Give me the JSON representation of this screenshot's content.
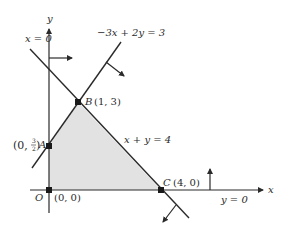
{
  "diagram": {
    "type": "linear-programming-feasible-region",
    "axes": {
      "x_label": "x",
      "y_label": "y"
    },
    "constraints": [
      {
        "id": "x0",
        "label": "x = 0"
      },
      {
        "id": "l1",
        "label": "−3x + 2y = 3"
      },
      {
        "id": "l2",
        "label": "x + y = 4"
      },
      {
        "id": "y0",
        "label": "y = 0"
      }
    ],
    "points": [
      {
        "id": "O",
        "name": "O",
        "coords": "(0, 0)"
      },
      {
        "id": "A",
        "name": "A",
        "coords_prefix": "(0, ",
        "frac_num": "3",
        "frac_den": "2",
        "coords_suffix": ")"
      },
      {
        "id": "B",
        "name": "B",
        "coords": "(1, 3)"
      },
      {
        "id": "C",
        "name": "C",
        "coords": "(4, 0)"
      }
    ],
    "colors": {
      "line": "#2a2a2a",
      "region_fill": "#e2e2e2",
      "background": "#ffffff"
    }
  }
}
